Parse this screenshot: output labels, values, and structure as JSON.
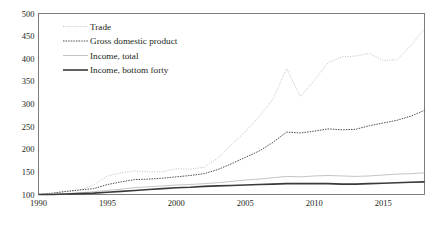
{
  "chart_data": {
    "type": "line",
    "title": "",
    "subtitle": "",
    "xlabel": "",
    "ylabel": "",
    "xlim": [
      1990,
      2018
    ],
    "ylim": [
      100,
      500
    ],
    "grid": false,
    "legend_position": "top-left",
    "x_ticks": [
      "1990",
      "1995",
      "2000",
      "2005",
      "2010",
      "2015"
    ],
    "x_tick_values": [
      1990,
      1995,
      2000,
      2005,
      2010,
      2015
    ],
    "y_ticks": [
      "100",
      "150",
      "200",
      "250",
      "300",
      "350",
      "400",
      "450",
      "500"
    ],
    "y_tick_values": [
      100,
      150,
      200,
      250,
      300,
      350,
      400,
      450,
      500
    ],
    "x": [
      1990,
      1991,
      1992,
      1993,
      1994,
      1995,
      1996,
      1997,
      1998,
      1999,
      2000,
      2001,
      2002,
      2003,
      2004,
      2005,
      2006,
      2007,
      2008,
      2009,
      2010,
      2011,
      2012,
      2013,
      2014,
      2015,
      2016,
      2017,
      2018
    ],
    "series": [
      {
        "name": "Trade",
        "style": "dotted",
        "color": "#b9b9b9",
        "width": 0.9,
        "values": [
          100,
          101,
          106,
          110,
          121,
          141,
          148,
          152,
          150,
          150,
          157,
          156,
          160,
          180,
          210,
          239,
          272,
          310,
          378,
          316,
          352,
          391,
          404,
          406,
          412,
          396,
          398,
          428,
          467
        ]
      },
      {
        "name": "Gross domestic product",
        "style": "dashed",
        "color": "#3a3a3a",
        "width": 0.9,
        "values": [
          100,
          103,
          107,
          110,
          113,
          122,
          128,
          133,
          134,
          136,
          139,
          142,
          146,
          155,
          168,
          182,
          196,
          215,
          238,
          236,
          240,
          245,
          243,
          244,
          252,
          258,
          264,
          273,
          286
        ]
      },
      {
        "name": "Income, total",
        "style": "solid",
        "color": "#bdbdbd",
        "width": 0.9,
        "values": [
          100,
          101,
          102,
          104,
          106,
          109,
          112,
          115,
          117,
          119,
          121,
          122,
          124,
          126,
          129,
          132,
          134,
          137,
          140,
          139,
          141,
          142,
          141,
          140,
          141,
          143,
          145,
          146,
          148
        ]
      },
      {
        "name": "Income, bottom forty",
        "style": "solid",
        "color": "#3a3a3a",
        "width": 1.6,
        "values": [
          100,
          100,
          101,
          102,
          103,
          105,
          107,
          109,
          111,
          113,
          115,
          116,
          118,
          119,
          120,
          121,
          122,
          123,
          124,
          124,
          124,
          124,
          123,
          123,
          124,
          125,
          126,
          127,
          128
        ]
      }
    ]
  },
  "legend": {
    "items": [
      {
        "label": "Trade"
      },
      {
        "label": "Gross domestic product"
      },
      {
        "label": "Income, total"
      },
      {
        "label": "Income, bottom forty"
      }
    ]
  }
}
